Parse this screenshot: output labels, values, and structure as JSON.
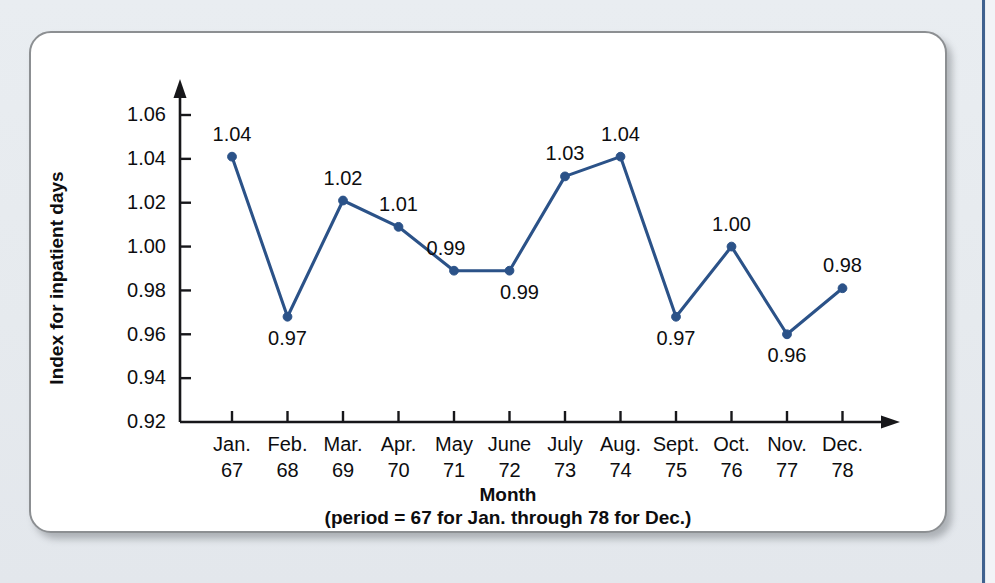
{
  "page": {
    "background_color": "#e8ecf0",
    "card_background_color": "#ffffff",
    "card_border_color": "#8c8f92",
    "rule_color": "#40628f"
  },
  "chart_data": {
    "type": "line",
    "title": "",
    "xlabel": "Month",
    "xlabel_sub": "(period = 67 for Jan. through 78 for Dec.)",
    "ylabel": "Index for inpatient days",
    "ylim": [
      0.92,
      1.07
    ],
    "ytick_values": [
      0.92,
      0.94,
      0.96,
      0.98,
      1.0,
      1.02,
      1.04,
      1.06
    ],
    "ytick_labels": [
      "0.92",
      "0.94",
      "0.96",
      "0.98",
      "1.00",
      "1.02",
      "1.04",
      "1.06"
    ],
    "grid": false,
    "legend": "none",
    "series_color": "#2b5288",
    "categories": [
      "Jan.",
      "Feb.",
      "Mar.",
      "Apr.",
      "May",
      "June",
      "July",
      "Aug.",
      "Sept.",
      "Oct.",
      "Nov.",
      "Dec."
    ],
    "period_numbers": [
      "67",
      "68",
      "69",
      "70",
      "71",
      "72",
      "73",
      "74",
      "75",
      "76",
      "77",
      "78"
    ],
    "values": [
      1.041,
      0.968,
      1.021,
      1.009,
      0.989,
      0.989,
      1.032,
      1.041,
      0.968,
      1.0,
      0.96,
      0.981
    ],
    "data_labels": [
      "1.04",
      "0.97",
      "1.02",
      "1.01",
      "0.99",
      "0.99",
      "1.03",
      "1.04",
      "0.97",
      "1.00",
      "0.96",
      "0.98"
    ],
    "data_label_positions": [
      "above",
      "below",
      "above",
      "above",
      "above-left",
      "below-right",
      "above",
      "above",
      "below",
      "above",
      "below",
      "above"
    ]
  }
}
